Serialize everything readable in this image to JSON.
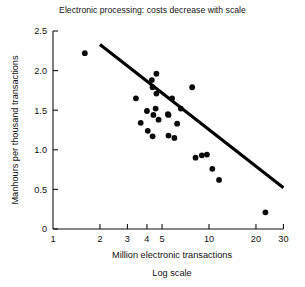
{
  "chart_data": {
    "type": "scatter",
    "title": "Electronic processing: costs decrease with scale",
    "xlabel": "Million electronic transactions",
    "xlabel_sub": "Log scale",
    "ylabel": "Manhours per thousand transactions",
    "xscale": "log",
    "xlim": [
      1,
      30
    ],
    "ylim": [
      0,
      2.5
    ],
    "xticks": [
      1,
      2,
      3,
      4,
      5,
      10,
      20,
      30
    ],
    "xtick_labels": [
      "1",
      "2",
      "3",
      "4",
      "5",
      "10",
      "20",
      "30"
    ],
    "yticks": [
      0,
      0.5,
      1.0,
      1.5,
      2.0,
      2.5
    ],
    "ytick_labels": [
      "0",
      "0.5",
      "1.0",
      "1.5",
      "2.0",
      "2.5"
    ],
    "grid": false,
    "legend": null,
    "marker": "filled-circle",
    "marker_color": "#0b0b0b",
    "points": [
      {
        "x": 1.6,
        "y": 2.22
      },
      {
        "x": 4.6,
        "y": 1.96
      },
      {
        "x": 4.3,
        "y": 1.88
      },
      {
        "x": 4.35,
        "y": 1.79
      },
      {
        "x": 7.8,
        "y": 1.79
      },
      {
        "x": 4.6,
        "y": 1.71
      },
      {
        "x": 3.4,
        "y": 1.65
      },
      {
        "x": 5.8,
        "y": 1.65
      },
      {
        "x": 4.55,
        "y": 1.52
      },
      {
        "x": 6.6,
        "y": 1.52
      },
      {
        "x": 4.0,
        "y": 1.49
      },
      {
        "x": 5.45,
        "y": 1.45
      },
      {
        "x": 4.4,
        "y": 1.44
      },
      {
        "x": 5.5,
        "y": 1.44
      },
      {
        "x": 4.75,
        "y": 1.38
      },
      {
        "x": 3.65,
        "y": 1.34
      },
      {
        "x": 6.25,
        "y": 1.33
      },
      {
        "x": 4.05,
        "y": 1.24
      },
      {
        "x": 5.5,
        "y": 1.18
      },
      {
        "x": 4.35,
        "y": 1.17
      },
      {
        "x": 6.0,
        "y": 1.15
      },
      {
        "x": 8.2,
        "y": 0.9
      },
      {
        "x": 9.0,
        "y": 0.93
      },
      {
        "x": 9.7,
        "y": 0.94
      },
      {
        "x": 10.5,
        "y": 0.76
      },
      {
        "x": 11.6,
        "y": 0.62
      },
      {
        "x": 23.0,
        "y": 0.21
      }
    ],
    "trendline": {
      "type": "line",
      "x": [
        2,
        30
      ],
      "y": [
        2.33,
        0.52
      ],
      "color": "#000000"
    }
  }
}
